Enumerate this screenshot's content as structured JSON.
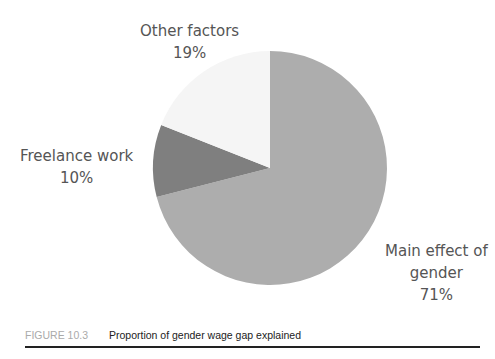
{
  "chart_data": {
    "type": "pie",
    "title": "Proportion of gender wage gap explained",
    "categories": [
      "Main effect of gender",
      "Freelance work",
      "Other factors"
    ],
    "values": [
      71,
      10,
      19
    ],
    "colors": [
      "#adadad",
      "#7f7f7f",
      "#f5f5f5"
    ],
    "labels": [
      {
        "line1": "Main effect of",
        "line2": "gender",
        "line3": "71%"
      },
      {
        "line1": "Freelance work",
        "line2": "10%"
      },
      {
        "line1": "Other factors",
        "line2": "19%"
      }
    ],
    "legend": "none"
  },
  "caption": {
    "number": "FIGURE 10.3",
    "text": "Proportion of gender wage gap explained"
  }
}
